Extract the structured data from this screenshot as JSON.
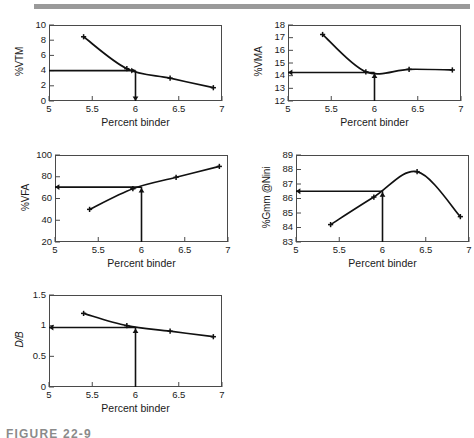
{
  "page": {
    "caption": "FIGURE 22-9",
    "top_rule_color": "#9a9a9a",
    "line_color": "#111111",
    "axis_color": "#4a4a4a",
    "background": "#ffffff"
  },
  "common": {
    "xlabel": "Percent binder",
    "xticks": [
      "5",
      "5.5",
      "6",
      "6.5",
      "7"
    ],
    "xlim": [
      5,
      7
    ],
    "design_binder": 6
  },
  "chart_data": [
    {
      "id": "vtm",
      "type": "line",
      "title": "",
      "xlabel": "Percent binder",
      "ylabel": "%VTM",
      "ylabel_italic": false,
      "xlim": [
        5,
        7
      ],
      "ylim": [
        0,
        10
      ],
      "yticks": [
        "0",
        "2",
        "4",
        "6",
        "8",
        "10"
      ],
      "ytick_values": [
        0,
        2,
        4,
        6,
        8,
        10
      ],
      "x": [
        5.4,
        5.9,
        6.4,
        6.9
      ],
      "values": [
        8.45,
        4.25,
        3.0,
        1.75
      ],
      "marker": "plus",
      "annotation": {
        "design_x": 6.0,
        "design_y": 4.0,
        "h_arrow_to": 5.0,
        "v_arrow_to": 0.0,
        "h_arrow_head": "right",
        "v_arrow_head": "down"
      }
    },
    {
      "id": "vma",
      "type": "line",
      "title": "",
      "xlabel": "Percent binder",
      "ylabel": "%VMA",
      "ylabel_italic": false,
      "xlim": [
        5,
        7
      ],
      "ylim": [
        12,
        18
      ],
      "yticks": [
        "12",
        "13",
        "14",
        "15",
        "16",
        "17",
        "18"
      ],
      "ytick_values": [
        12,
        13,
        14,
        15,
        16,
        17,
        18
      ],
      "x": [
        5.4,
        5.9,
        6.4,
        6.9
      ],
      "values": [
        17.25,
        14.3,
        14.5,
        14.45
      ],
      "marker": "plus",
      "annotation": {
        "design_x": 6.0,
        "design_y": 14.25,
        "h_arrow_to": 5.0,
        "v_arrow_to": 12.0,
        "h_arrow_head": "left",
        "v_arrow_head": "up"
      }
    },
    {
      "id": "vfa",
      "type": "line",
      "title": "",
      "xlabel": "Percent binder",
      "ylabel": "%VFA",
      "ylabel_italic": false,
      "xlim": [
        5,
        7
      ],
      "ylim": [
        20,
        100
      ],
      "yticks": [
        "20",
        "40",
        "60",
        "80",
        "100"
      ],
      "ytick_values": [
        20,
        40,
        60,
        80,
        100
      ],
      "x": [
        5.4,
        5.9,
        6.4,
        6.9
      ],
      "values": [
        50,
        69,
        79.5,
        89.5
      ],
      "marker": "plus",
      "annotation": {
        "design_x": 6.0,
        "design_y": 70.5,
        "h_arrow_to": 5.0,
        "v_arrow_to": 20.0,
        "h_arrow_head": "left",
        "v_arrow_head": "up"
      }
    },
    {
      "id": "gmm-nini",
      "type": "line",
      "title": "",
      "xlabel": "Percent binder",
      "ylabel": "%Gmm @Nini",
      "ylabel_italic": false,
      "xlim": [
        5,
        7
      ],
      "ylim": [
        83,
        89
      ],
      "yticks": [
        "83",
        "84",
        "85",
        "86",
        "87",
        "88",
        "89"
      ],
      "ytick_values": [
        83,
        84,
        85,
        86,
        87,
        88,
        89
      ],
      "x": [
        5.4,
        5.9,
        6.4,
        6.9
      ],
      "values": [
        84.2,
        86.1,
        87.85,
        84.75
      ],
      "marker": "plus",
      "annotation": {
        "design_x": 6.0,
        "design_y": 86.5,
        "h_arrow_to": 5.0,
        "v_arrow_to": 83.0,
        "h_arrow_head": "left",
        "v_arrow_head": "up"
      }
    },
    {
      "id": "db",
      "type": "line",
      "title": "",
      "xlabel": "Percent binder",
      "ylabel": "D/B",
      "ylabel_italic": true,
      "xlim": [
        5,
        7
      ],
      "ylim": [
        0,
        1.5
      ],
      "yticks": [
        "0",
        "0.5",
        "1",
        "1.5"
      ],
      "ytick_values": [
        0,
        0.5,
        1,
        1.5
      ],
      "x": [
        5.4,
        5.9,
        6.4,
        6.9
      ],
      "values": [
        1.2,
        1.0,
        0.91,
        0.82
      ],
      "marker": "plus",
      "annotation": {
        "design_x": 6.0,
        "design_y": 0.97,
        "h_arrow_to": 5.0,
        "v_arrow_to": 0.0,
        "h_arrow_head": "left",
        "v_arrow_head": "up"
      }
    }
  ]
}
